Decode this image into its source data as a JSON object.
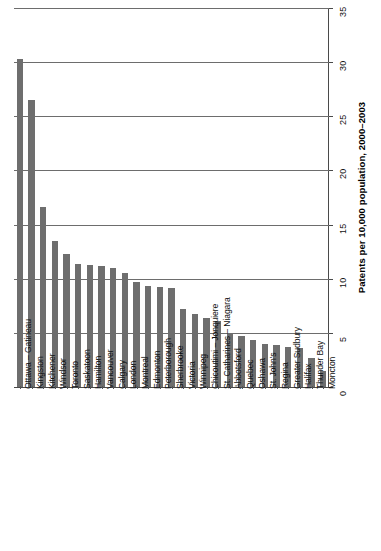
{
  "chart_data": {
    "type": "bar",
    "title": "",
    "subtitle": "",
    "xlabel": "",
    "ylabel": "Patents per 10,000 population, 2000–2003",
    "ylim": [
      0,
      35
    ],
    "yticks": [
      0,
      5,
      10,
      15,
      20,
      25,
      30,
      35
    ],
    "ytick_labels": [
      "0",
      "5",
      "10",
      "15",
      "20",
      "25",
      "30",
      "35"
    ],
    "grid": true,
    "legend": null,
    "orientation": "vertical",
    "bar_color": "#6e6e6e",
    "categories": [
      "Ottawa – Gatineau",
      "Kingston",
      "Kitchener",
      "Windsor",
      "Toronto",
      "Saskatoon",
      "Hamilton",
      "Vancouver",
      "Calgary",
      "London",
      "Montreal",
      "Edmonton",
      "Peterborough",
      "Sherbrooke",
      "Victoria",
      "Winnipeg",
      "Chicoutimi – Jonquiere",
      "St. Catharines – Niagara",
      "Abbotsford",
      "Quebec",
      "Oshawa",
      "St. John's",
      "Regina",
      "Greater Sudbury",
      "Halifax",
      "Thunder Bay",
      "Moncton"
    ],
    "values": [
      30.3,
      26.5,
      16.6,
      13.5,
      12.3,
      11.4,
      11.3,
      11.2,
      11.0,
      10.5,
      9.7,
      9.3,
      9.2,
      9.1,
      7.2,
      6.7,
      6.4,
      6.1,
      5.0,
      4.7,
      4.3,
      4.0,
      3.9,
      3.7,
      3.6,
      2.7,
      1.5
    ]
  }
}
